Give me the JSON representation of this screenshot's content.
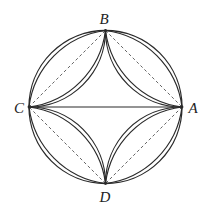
{
  "figure": {
    "type": "geometry",
    "colors": {
      "stroke": "#2a2a2a",
      "dashed": "#555555",
      "label": "#222222",
      "background": "#ffffff"
    },
    "circle": {
      "cx": 105.5,
      "cy": 107,
      "r": 76.5
    },
    "points": {
      "A": {
        "x": 182,
        "y": 107
      },
      "B": {
        "x": 105.5,
        "y": 30.5
      },
      "C": {
        "x": 29,
        "y": 107
      },
      "D": {
        "x": 105.5,
        "y": 183.5
      }
    },
    "labels": {
      "A": {
        "text": "A",
        "x": 193,
        "y": 108
      },
      "B": {
        "text": "B",
        "x": 104,
        "y": 19
      },
      "C": {
        "text": "C",
        "x": 19,
        "y": 108
      },
      "D": {
        "text": "D",
        "x": 105,
        "y": 197
      }
    },
    "solid_segments": [
      {
        "from": "C",
        "to": "A"
      }
    ],
    "dashed_segments": [
      {
        "from": "B",
        "to": "A"
      },
      {
        "from": "A",
        "to": "D"
      },
      {
        "from": "D",
        "to": "C"
      },
      {
        "from": "C",
        "to": "B"
      }
    ],
    "arc_radii": {
      "circle_reflection": 76.5,
      "secondary": 88.3
    }
  }
}
